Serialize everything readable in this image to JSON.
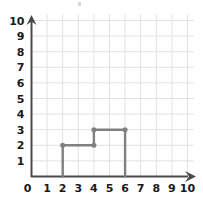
{
  "figure": {
    "title": "",
    "background_color": "#ffffff",
    "grid_color": "#e2e2e2",
    "axis_color": "#4a4a4a",
    "shape_color": "#808080",
    "label_color": "#1a1a1a"
  },
  "axes": {
    "x_label": "",
    "y_label": "",
    "x_ticks": [
      "0",
      "1",
      "2",
      "3",
      "4",
      "5",
      "6",
      "7",
      "8",
      "9",
      "10"
    ],
    "y_ticks": [
      "0",
      "1",
      "2",
      "3",
      "4",
      "5",
      "6",
      "7",
      "8",
      "9",
      "10"
    ],
    "origin_label": "0"
  },
  "chart_data": {
    "type": "line",
    "title": "",
    "xlabel": "",
    "ylabel": "",
    "xlim": [
      0,
      10
    ],
    "ylim": [
      0,
      10
    ],
    "grid": true,
    "legend": "none",
    "series": [
      {
        "name": "step-figure",
        "color": "#808080",
        "closed": false,
        "marker": "circle",
        "x": [
          2,
          2,
          4,
          4,
          6,
          6
        ],
        "y": [
          0,
          2,
          2,
          3,
          3,
          0
        ],
        "vertex_markers": [
          {
            "x": 2,
            "y": 2
          },
          {
            "x": 4,
            "y": 2
          },
          {
            "x": 4,
            "y": 3
          },
          {
            "x": 6,
            "y": 3
          }
        ]
      }
    ]
  }
}
